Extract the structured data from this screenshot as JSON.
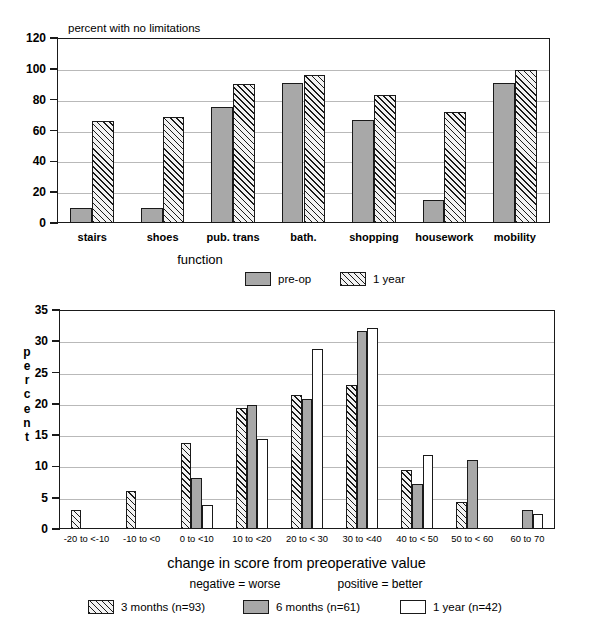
{
  "chart_data": [
    {
      "id": "function-chart",
      "type": "bar",
      "title": "percent with no limitations",
      "xlabel": "function",
      "ylabel": "",
      "ylim": [
        0,
        120
      ],
      "yticks": [
        0,
        20,
        40,
        60,
        80,
        100,
        120
      ],
      "grid": true,
      "legend_position": "below",
      "categories": [
        "stairs",
        "shoes",
        "pub. trans",
        "bath.",
        "shopping",
        "housework",
        "mobility"
      ],
      "series": [
        {
          "name": "pre-op",
          "style": "solid-gray",
          "values": [
            10,
            10,
            75,
            91,
            67,
            15,
            91
          ]
        },
        {
          "name": "1 year",
          "style": "hatched",
          "values": [
            66,
            69,
            90,
            96,
            83,
            72,
            99
          ]
        }
      ]
    },
    {
      "id": "change-score-chart",
      "type": "bar",
      "title": "",
      "xlabel": "change in score from preoperative value",
      "xlabel_sub_left": "negative = worse",
      "xlabel_sub_right": "positive = better",
      "ylabel": "percent",
      "ylim": [
        0,
        35
      ],
      "yticks": [
        0,
        5,
        10,
        15,
        20,
        25,
        30,
        35
      ],
      "grid": true,
      "legend_position": "below",
      "categories": [
        "-20 to <-10",
        "-10 to <0",
        "0 to <10",
        "10 to <20",
        "20 to < 30",
        "30 to <40",
        "40 to < 50",
        "50 to < 60",
        "60 to 70"
      ],
      "series": [
        {
          "name": "3 months (n=93)",
          "style": "hatched",
          "values": [
            3.0,
            6.0,
            13.7,
            19.3,
            21.4,
            23.0,
            9.5,
            4.3,
            0.0
          ]
        },
        {
          "name": "6 months (n=61)",
          "style": "solid-gray",
          "values": [
            0.0,
            0.0,
            8.2,
            19.8,
            20.7,
            31.6,
            7.2,
            11.1,
            3.0
          ]
        },
        {
          "name": "1 year (n=42)",
          "style": "white",
          "values": [
            0.0,
            0.0,
            3.8,
            14.4,
            28.8,
            32.2,
            11.9,
            0.0,
            2.4
          ]
        }
      ]
    }
  ],
  "top_chart": {
    "caption": "percent with no limitations",
    "yticks": [
      "120",
      "100",
      "80",
      "60",
      "40",
      "20",
      "0"
    ],
    "categories": [
      "stairs",
      "shoes",
      "pub. trans",
      "bath.",
      "shopping",
      "housework",
      "mobility"
    ],
    "axis_title": "function",
    "legend": [
      {
        "label": "pre-op",
        "style": "solid-gray"
      },
      {
        "label": "1 year",
        "style": "hatched"
      }
    ]
  },
  "bottom_chart": {
    "ylabel_letters": [
      "p",
      "e",
      "r",
      "c",
      "e",
      "n",
      "t"
    ],
    "yticks": [
      "35",
      "30",
      "25",
      "20",
      "15",
      "10",
      "5",
      "0"
    ],
    "categories": [
      "-20 to <-10",
      "-10 to <0",
      "0 to <10",
      "10 to <20",
      "20 to < 30",
      "30 to <40",
      "40 to < 50",
      "50 to < 60",
      "60 to 70"
    ],
    "axis_title": "change in score from preoperative value",
    "axis_subtitle_left": "negative = worse",
    "axis_subtitle_right": "positive = better",
    "legend": [
      {
        "label": "3 months (n=93)",
        "style": "hatched"
      },
      {
        "label": "6 months (n=61)",
        "style": "solid-gray"
      },
      {
        "label": "1 year (n=42)",
        "style": "white"
      }
    ]
  },
  "colors": {
    "gray_fill": "#a8a8a8",
    "outline": "#1a1a1a",
    "gridline": "#b9b9b9",
    "background": "#ffffff"
  }
}
